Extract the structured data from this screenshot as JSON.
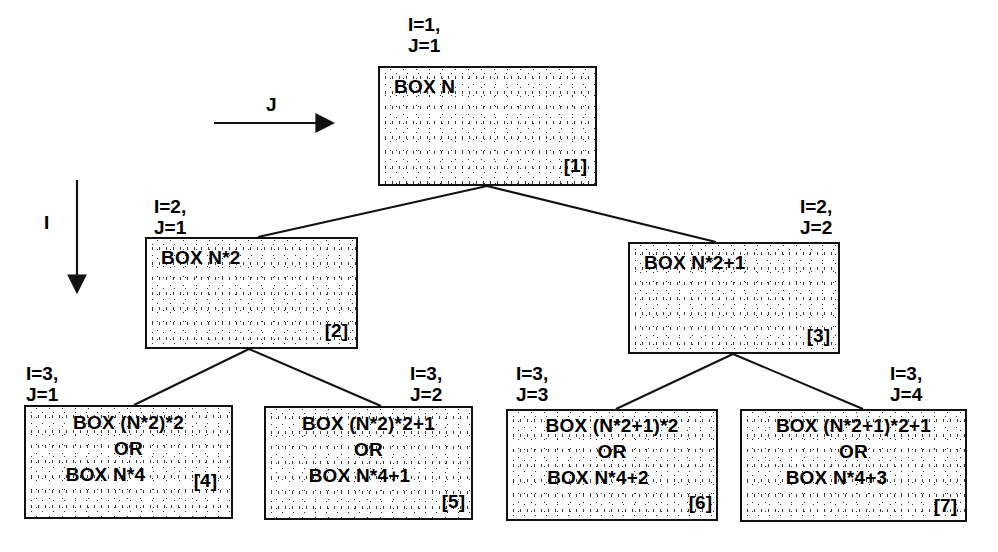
{
  "diagram": {
    "axes": [
      {
        "name": "J",
        "label": "J",
        "direction": "horizontal-right"
      },
      {
        "name": "I",
        "label": "I",
        "direction": "vertical-down"
      }
    ],
    "nodes": [
      {
        "id": "1",
        "tag": "[1]",
        "lines": [
          "BOX N"
        ],
        "ij": {
          "i": "I=1,",
          "j": "J=1"
        }
      },
      {
        "id": "2",
        "tag": "[2]",
        "lines": [
          "BOX N*2"
        ],
        "ij": {
          "i": "I=2,",
          "j": "J=1"
        }
      },
      {
        "id": "3",
        "tag": "[3]",
        "lines": [
          "BOX N*2+1"
        ],
        "ij": {
          "i": "I=2,",
          "j": "J=2"
        }
      },
      {
        "id": "4",
        "tag": "[4]",
        "lines": [
          "BOX (N*2)*2",
          "OR",
          "BOX N*4"
        ],
        "ij": {
          "i": "I=3,",
          "j": "J=1"
        }
      },
      {
        "id": "5",
        "tag": "[5]",
        "lines": [
          "BOX (N*2)*2+1",
          "OR",
          "BOX N*4+1"
        ],
        "ij": {
          "i": "I=3,",
          "j": "J=2"
        }
      },
      {
        "id": "6",
        "tag": "[6]",
        "lines": [
          "BOX (N*2+1)*2",
          "OR",
          "BOX N*4+2"
        ],
        "ij": {
          "i": "I=3,",
          "j": "J=3"
        }
      },
      {
        "id": "7",
        "tag": "[7]",
        "lines": [
          "BOX (N*2+1)*2+1",
          "OR",
          "BOX N*4+3"
        ],
        "ij": {
          "i": "I=3,",
          "j": "J=4"
        }
      }
    ],
    "edges": [
      {
        "from": "1",
        "to": "2"
      },
      {
        "from": "1",
        "to": "3"
      },
      {
        "from": "2",
        "to": "4"
      },
      {
        "from": "2",
        "to": "5"
      },
      {
        "from": "3",
        "to": "6"
      },
      {
        "from": "3",
        "to": "7"
      }
    ],
    "colors": {
      "line": "#111111",
      "text": "#000000",
      "fill": "#fdfdfd",
      "background": "#ffffff"
    }
  }
}
